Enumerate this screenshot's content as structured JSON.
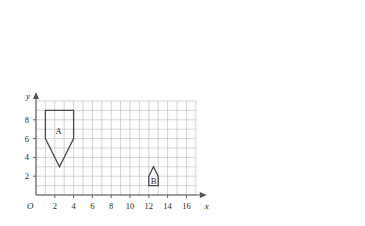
{
  "figure": {
    "background_color": "#ffffff",
    "grid_color": "#c9c9c9",
    "axis_color": "#555555",
    "shape_stroke_color": "#4a4a4a",
    "shape_fill": "none"
  },
  "axes": {
    "origin_label": "O",
    "x_axis_name": "x",
    "y_axis_name": "y",
    "x_tick_labels": [
      "2",
      "4",
      "6",
      "8",
      "10",
      "12",
      "14",
      "16"
    ],
    "x_tick_values": [
      2,
      4,
      6,
      8,
      10,
      12,
      14,
      16
    ],
    "y_tick_labels": [
      "2",
      "4",
      "6",
      "8"
    ],
    "y_tick_values": [
      2,
      4,
      6,
      8
    ],
    "x_range": [
      0,
      17
    ],
    "y_range": [
      0,
      10
    ],
    "grid_step": 1,
    "grid_visible": true
  },
  "chart_data": {
    "type": "scatter",
    "title": "",
    "xlabel": "x",
    "ylabel": "y",
    "xlim": [
      0,
      17
    ],
    "ylim": [
      0,
      10
    ],
    "grid": true,
    "legend": "none",
    "shapes": [
      {
        "label": "A",
        "label_position": [
          2.4,
          6.8
        ],
        "vertices": [
          [
            1,
            9
          ],
          [
            4,
            9
          ],
          [
            4,
            6
          ],
          [
            2.5,
            3
          ],
          [
            1,
            6
          ]
        ],
        "closed": true
      },
      {
        "label": "B",
        "label_position": [
          12.5,
          1.5
        ],
        "vertices": [
          [
            12,
            1
          ],
          [
            13,
            1
          ],
          [
            13,
            2
          ],
          [
            12.5,
            3
          ],
          [
            12,
            2
          ]
        ],
        "closed": true
      }
    ]
  }
}
